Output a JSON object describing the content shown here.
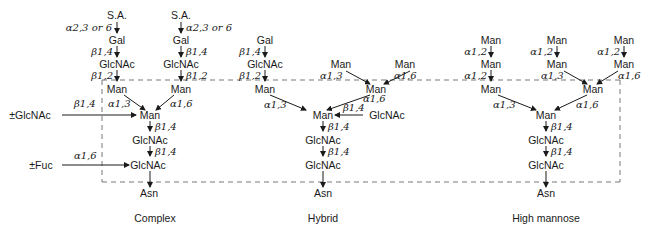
{
  "structures": [
    {
      "name": "Complex",
      "residues": {
        "sa_left": "S.A.",
        "sa_right": "S.A.",
        "gal_left": "Gal",
        "gal_right": "Gal",
        "glcnac_left": "GlcNAc",
        "glcnac_right": "GlcNAc",
        "man_left": "Man",
        "man_right": "Man",
        "man_core": "Man",
        "glcnac_core1": "GlcNAc",
        "glcnac_core2": "GlcNAc",
        "asn": "Asn",
        "opt_glcnac": "±GlcNAc",
        "opt_fuc": "±Fuc"
      },
      "linkages": {
        "sa_gal_left": "α2,3 or 6",
        "sa_gal_right": "α2,3 or 6",
        "gal_glcnac_left": "β1,4",
        "gal_glcnac_right": "β1,4",
        "glcnac_man_left": "β1,2",
        "glcnac_man_right": "β1,2",
        "man_left_core": "α1,3",
        "man_right_core": "α1,6",
        "bisect": "β1,4",
        "core_man_glcnac": "β1,4",
        "core_glcnac_glcnac": "β1,4",
        "fuc": "α1,6"
      }
    },
    {
      "name": "Hybrid",
      "residues": {
        "gal": "Gal",
        "glcnac_arm": "GlcNAc",
        "man_left": "Man",
        "man_top_a": "Man",
        "man_top_b": "Man",
        "man_right": "Man",
        "man_core": "Man",
        "bisect_glcnac": "GlcNAc",
        "glcnac_core1": "GlcNAc",
        "glcnac_core2": "GlcNAc",
        "asn": "Asn"
      },
      "linkages": {
        "gal_glcnac": "β1,4",
        "glcnac_man": "β1,2",
        "man_top_a": "α1,3",
        "man_top_b": "α1,6",
        "man_left_core": "α1,3",
        "man_right_core": "α1,6",
        "bisect": "β1,4",
        "core_man_glcnac": "β1,4",
        "core_glcnac_glcnac": "β1,4"
      }
    },
    {
      "name": "High mannose",
      "residues": {
        "man_a1": "Man",
        "man_b1": "Man",
        "man_c1": "Man",
        "man_a2": "Man",
        "man_b2": "Man",
        "man_c2": "Man",
        "man_left": "Man",
        "man_right": "Man",
        "man_core": "Man",
        "glcnac_core1": "GlcNAc",
        "glcnac_core2": "GlcNAc",
        "asn": "Asn"
      },
      "linkages": {
        "a12_1": "α1,2",
        "b12_1": "α1,2",
        "c12": "α1,2",
        "a12_2": "α1,2",
        "b13": "α1,3",
        "c16": "α1,6",
        "man_left_core": "α1,3",
        "man_right_core": "α1,6",
        "core_man_glcnac": "β1,4",
        "core_glcnac_glcnac": "β1,4"
      }
    }
  ]
}
